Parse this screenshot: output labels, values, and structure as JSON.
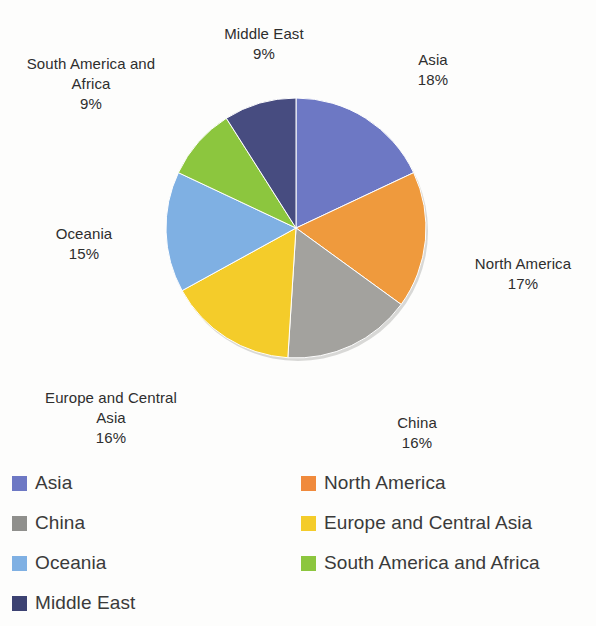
{
  "chart_data": {
    "type": "pie",
    "title": "",
    "subtitle": "",
    "xlabel": "",
    "ylabel": "",
    "grid": false,
    "legend_position": "bottom",
    "legend_columns": 2,
    "start_angle_deg": 0,
    "direction": "clockwise",
    "units": "percent",
    "total": 100,
    "categories": [
      "Asia",
      "North America",
      "China",
      "Europe and Central Asia",
      "Oceania",
      "South America and Africa",
      "Middle East"
    ],
    "values": [
      18,
      17,
      16,
      16,
      15,
      9,
      9
    ],
    "colors": [
      "#6d78c4",
      "#ef9a3d",
      "#a3a29e",
      "#f4cc2a",
      "#7fb0e3",
      "#8cc63e",
      "#474c80"
    ],
    "slices": [
      {
        "label": "Asia",
        "value": 18,
        "value_text": "18%",
        "color": "#6d78c4"
      },
      {
        "label": "North America",
        "value": 17,
        "value_text": "17%",
        "color": "#ef9a3d"
      },
      {
        "label": "China",
        "value": 16,
        "value_text": "16%",
        "color": "#a3a29e"
      },
      {
        "label": "Europe and Central Asia",
        "value": 16,
        "value_text": "16%",
        "color": "#f4cc2a"
      },
      {
        "label": "Oceania",
        "value": 15,
        "value_text": "15%",
        "color": "#7fb0e3"
      },
      {
        "label": "South America and Africa",
        "value": 9,
        "value_text": "9%",
        "color": "#8cc63e"
      },
      {
        "label": "Middle East",
        "value": 9,
        "value_text": "9%",
        "color": "#474c80"
      }
    ]
  },
  "callouts": {
    "asia": {
      "name": "Asia",
      "percent": "18%"
    },
    "north_america": {
      "name": "North America",
      "percent": "17%"
    },
    "china": {
      "name": "China",
      "percent": "16%"
    },
    "europe": {
      "name": "Europe and Central\nAsia",
      "percent": "16%"
    },
    "oceania": {
      "name": "Oceania",
      "percent": "15%"
    },
    "south_america": {
      "name": "South America and\nAfrica",
      "percent": "9%"
    },
    "middle_east": {
      "name": "Middle East",
      "percent": "9%"
    }
  },
  "legend": {
    "left_column": [
      {
        "label": "Asia",
        "color": "#6d78c4"
      },
      {
        "label": "China",
        "color": "#8f8f8c"
      },
      {
        "label": "Oceania",
        "color": "#7fb0e3"
      },
      {
        "label": "Middle East",
        "color": "#3c4272"
      }
    ],
    "right_column": [
      {
        "label": "North America",
        "color": "#f08a3c"
      },
      {
        "label": "Europe and Central Asia",
        "color": "#f4cc2a"
      },
      {
        "label": "South America and Africa",
        "color": "#8cc63e"
      }
    ]
  }
}
